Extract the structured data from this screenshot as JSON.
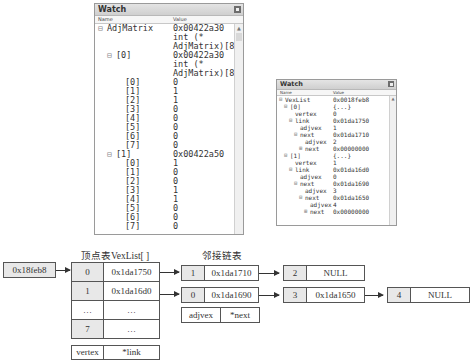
{
  "watch1": {
    "title": "Watch",
    "col_name": "Name",
    "col_value": "Value",
    "rows": [
      {
        "name": "AdjMatrix",
        "value": "0x00422a30",
        "indent": 0,
        "expander": "minus"
      },
      {
        "name": "",
        "value": "int (*",
        "indent": 0,
        "expander": ""
      },
      {
        "name": "",
        "value": "AdjMatrix)[8]",
        "indent": 0,
        "expander": ""
      },
      {
        "name": "[0]",
        "value": "0x00422a30",
        "indent": 1,
        "expander": "minus"
      },
      {
        "name": "",
        "value": "int (*",
        "indent": 1,
        "expander": ""
      },
      {
        "name": "",
        "value": "AdjMatrix)[8]",
        "indent": 1,
        "expander": ""
      },
      {
        "name": "[0]",
        "value": "0",
        "indent": 2,
        "expander": ""
      },
      {
        "name": "[1]",
        "value": "1",
        "indent": 2,
        "expander": ""
      },
      {
        "name": "[2]",
        "value": "1",
        "indent": 2,
        "expander": ""
      },
      {
        "name": "[3]",
        "value": "0",
        "indent": 2,
        "expander": ""
      },
      {
        "name": "[4]",
        "value": "0",
        "indent": 2,
        "expander": ""
      },
      {
        "name": "[5]",
        "value": "0",
        "indent": 2,
        "expander": ""
      },
      {
        "name": "[6]",
        "value": "0",
        "indent": 2,
        "expander": ""
      },
      {
        "name": "[7]",
        "value": "0",
        "indent": 2,
        "expander": ""
      },
      {
        "name": "[1]",
        "value": "0x00422a50",
        "indent": 1,
        "expander": "minus"
      },
      {
        "name": "[0]",
        "value": "1",
        "indent": 2,
        "expander": ""
      },
      {
        "name": "[1]",
        "value": "0",
        "indent": 2,
        "expander": ""
      },
      {
        "name": "[2]",
        "value": "0",
        "indent": 2,
        "expander": ""
      },
      {
        "name": "[3]",
        "value": "1",
        "indent": 2,
        "expander": ""
      },
      {
        "name": "[4]",
        "value": "1",
        "indent": 2,
        "expander": ""
      },
      {
        "name": "[5]",
        "value": "0",
        "indent": 2,
        "expander": ""
      },
      {
        "name": "[6]",
        "value": "0",
        "indent": 2,
        "expander": ""
      },
      {
        "name": "[7]",
        "value": "0",
        "indent": 2,
        "expander": ""
      }
    ]
  },
  "watch2": {
    "title": "Watch",
    "col_name": "Name",
    "col_value": "Value",
    "rows": [
      {
        "name": "VexList",
        "value": "0x0018feb8",
        "indent": 0,
        "expander": "minus"
      },
      {
        "name": "[0]",
        "value": "{...}",
        "indent": 1,
        "expander": "minus"
      },
      {
        "name": "vertex",
        "value": "0",
        "indent": 2,
        "expander": ""
      },
      {
        "name": "link",
        "value": "0x01da1750",
        "indent": 2,
        "expander": "minus"
      },
      {
        "name": "adjvex",
        "value": "1",
        "indent": 3,
        "expander": ""
      },
      {
        "name": "next",
        "value": "0x01da1710",
        "indent": 3,
        "expander": "minus"
      },
      {
        "name": "adjvex",
        "value": "2",
        "indent": 4,
        "expander": ""
      },
      {
        "name": "next",
        "value": "0x00000000",
        "indent": 4,
        "expander": "plus"
      },
      {
        "name": "[1]",
        "value": "{...}",
        "indent": 1,
        "expander": "minus"
      },
      {
        "name": "vertex",
        "value": "1",
        "indent": 2,
        "expander": ""
      },
      {
        "name": "link",
        "value": "0x01da16d0",
        "indent": 2,
        "expander": "minus"
      },
      {
        "name": "adjvex",
        "value": "0",
        "indent": 3,
        "expander": ""
      },
      {
        "name": "next",
        "value": "0x01da1690",
        "indent": 3,
        "expander": "minus"
      },
      {
        "name": "adjvex",
        "value": "3",
        "indent": 4,
        "expander": ""
      },
      {
        "name": "next",
        "value": "0x01da1650",
        "indent": 4,
        "expander": "minus"
      },
      {
        "name": "adjvex",
        "value": "4",
        "indent": 5,
        "expander": ""
      },
      {
        "name": "next",
        "value": "0x00000000",
        "indent": 5,
        "expander": "plus"
      }
    ]
  },
  "diagram": {
    "pointer_box": "0x18feb8",
    "vexlist_title": "顶点表VexList[ ]",
    "adjlist_title": "邻接链表",
    "vexlist": [
      {
        "vertex": "0",
        "link": "0x1da1750"
      },
      {
        "vertex": "1",
        "link": "0x1da16d0"
      },
      {
        "vertex": "…",
        "link": "…"
      },
      {
        "vertex": "7",
        "link": "…"
      }
    ],
    "vex_legend": {
      "vertex": "vertex",
      "link": "*link"
    },
    "chain0": [
      {
        "adjvex": "1",
        "next": "0x1da1710"
      },
      {
        "adjvex": "2",
        "next": "NULL"
      }
    ],
    "chain1": [
      {
        "adjvex": "0",
        "next": "0x1da1690"
      },
      {
        "adjvex": "3",
        "next": "0x1da1650"
      },
      {
        "adjvex": "4",
        "next": "NULL"
      }
    ],
    "edge_legend": {
      "adjvex": "adjvex",
      "next": "*next"
    }
  }
}
